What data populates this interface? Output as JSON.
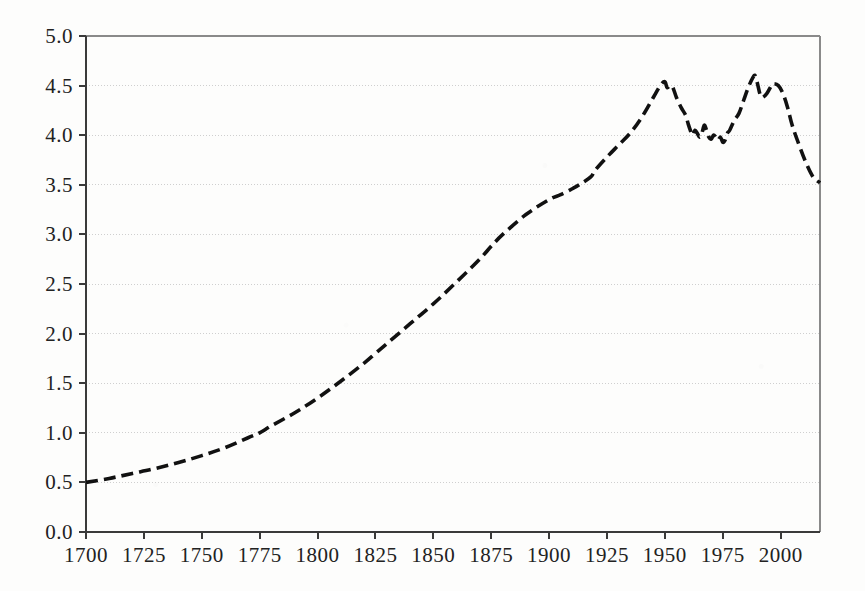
{
  "chart_data": {
    "type": "line",
    "title": "",
    "subtitle": "",
    "xlabel": "",
    "ylabel": "",
    "xlim": [
      1700,
      2017
    ],
    "ylim": [
      0.0,
      5.0
    ],
    "grid": true,
    "grid_axis": "y",
    "legend": "none",
    "line_style": "dashed",
    "line_color": "#111111",
    "background_color": "#fdfdfc",
    "axis_color": "#3a3a3a",
    "gridline_color": "#cfcfcf",
    "x_ticks": [
      1700,
      1725,
      1750,
      1775,
      1800,
      1825,
      1850,
      1875,
      1900,
      1925,
      1950,
      1975,
      2000
    ],
    "x_tick_labels": [
      "1700",
      "1725",
      "1750",
      "1775",
      "1800",
      "1825",
      "1850",
      "1875",
      "1900",
      "1925",
      "1950",
      "1975",
      "2000"
    ],
    "y_ticks": [
      0.0,
      0.5,
      1.0,
      1.5,
      2.0,
      2.5,
      3.0,
      3.5,
      4.0,
      4.5,
      5.0
    ],
    "y_tick_labels": [
      "0.0",
      "0.5",
      "1.0",
      "1.5",
      "2.0",
      "2.5",
      "3.0",
      "3.5",
      "4.0",
      "4.5",
      "5.0"
    ],
    "series": [
      {
        "name": "series-1",
        "x": [
          1700,
          1710,
          1720,
          1730,
          1740,
          1750,
          1760,
          1770,
          1775,
          1780,
          1790,
          1800,
          1810,
          1820,
          1825,
          1830,
          1840,
          1850,
          1860,
          1870,
          1875,
          1880,
          1890,
          1900,
          1905,
          1910,
          1913,
          1918,
          1920,
          1925,
          1930,
          1935,
          1940,
          1945,
          1948,
          1950,
          1951,
          1953,
          1955,
          1957,
          1959,
          1960,
          1961,
          1962,
          1963,
          1964,
          1965,
          1966,
          1967,
          1968,
          1969,
          1970,
          1971,
          1972,
          1973,
          1974,
          1975,
          1976,
          1977,
          1978,
          1980,
          1982,
          1984,
          1986,
          1988,
          1989,
          1990,
          1991,
          1992,
          1994,
          1996,
          1997,
          1999,
          2001,
          2003,
          2005,
          2008,
          2011,
          2014,
          2017
        ],
        "y": [
          0.5,
          0.54,
          0.59,
          0.64,
          0.7,
          0.77,
          0.85,
          0.95,
          1.0,
          1.07,
          1.2,
          1.35,
          1.52,
          1.7,
          1.8,
          1.9,
          2.1,
          2.3,
          2.52,
          2.75,
          2.88,
          3.0,
          3.2,
          3.35,
          3.4,
          3.46,
          3.5,
          3.58,
          3.65,
          3.78,
          3.9,
          4.02,
          4.18,
          4.38,
          4.5,
          4.54,
          4.48,
          4.5,
          4.38,
          4.28,
          4.2,
          4.12,
          4.05,
          4.0,
          4.05,
          4.02,
          3.98,
          4.02,
          4.1,
          4.05,
          3.98,
          3.96,
          4.0,
          3.98,
          3.95,
          3.98,
          3.93,
          3.95,
          4.02,
          4.05,
          4.15,
          4.22,
          4.35,
          4.48,
          4.58,
          4.6,
          4.52,
          4.42,
          4.38,
          4.42,
          4.5,
          4.52,
          4.5,
          4.42,
          4.28,
          4.1,
          3.9,
          3.72,
          3.58,
          3.52
        ]
      }
    ]
  },
  "axes_geometry": {
    "plot_left": 86,
    "plot_right": 820,
    "plot_top": 36,
    "plot_bottom": 532
  }
}
